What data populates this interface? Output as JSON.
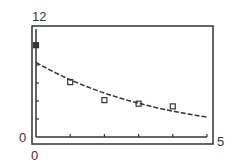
{
  "chart_data": {
    "type": "scatter",
    "title": "",
    "xlabel": "",
    "ylabel": "",
    "xlim": [
      0,
      5
    ],
    "ylim": [
      0,
      12
    ],
    "grid": false,
    "legend": "none",
    "tick_labels": {
      "x_min": "0",
      "x_max": "5",
      "y_min": "0",
      "y_max": "12"
    },
    "x_ticks": [
      1,
      2,
      3,
      4,
      5
    ],
    "y_ticks": [
      2,
      4,
      6,
      8,
      10
    ],
    "series": [
      {
        "name": "data",
        "kind": "scatter",
        "marker": "square",
        "x": [
          0,
          1,
          2,
          3,
          4
        ],
        "y": [
          10.2,
          6.1,
          4.1,
          3.7,
          3.4
        ]
      },
      {
        "name": "fit",
        "kind": "line",
        "style": "dashed",
        "model": "exponential",
        "a": 8.3,
        "k": 0.265
      }
    ]
  }
}
